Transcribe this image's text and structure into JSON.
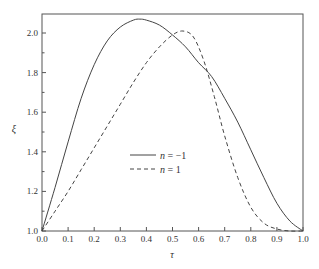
{
  "chart_data": {
    "type": "line",
    "title": "",
    "xlabel": "τ",
    "ylabel": "ξ",
    "xlim": [
      0.0,
      1.0
    ],
    "ylim": [
      1.0,
      2.09
    ],
    "grid": false,
    "legend_position": "center-right inside plot",
    "x_ticks": [
      "0.0",
      "0.1",
      "0.2",
      "0.3",
      "0.4",
      "0.5",
      "0.6",
      "0.7",
      "0.8",
      "0.9",
      "1.0"
    ],
    "y_ticks": [
      "1.0",
      "1.2",
      "1.4",
      "1.6",
      "1.8",
      "2.0"
    ],
    "series": [
      {
        "name": "n = -1",
        "legend_var": "n",
        "legend_value": "= −1",
        "style": "solid",
        "color": "#444444",
        "x": [
          0.0,
          0.05,
          0.1,
          0.15,
          0.2,
          0.25,
          0.3,
          0.35,
          0.375,
          0.4,
          0.45,
          0.5,
          0.55,
          0.6,
          0.65,
          0.7,
          0.75,
          0.8,
          0.85,
          0.9,
          0.95,
          1.0
        ],
        "y": [
          1.0,
          1.22,
          1.45,
          1.67,
          1.84,
          1.96,
          2.03,
          2.065,
          2.07,
          2.065,
          2.04,
          1.99,
          1.93,
          1.85,
          1.78,
          1.67,
          1.55,
          1.41,
          1.27,
          1.14,
          1.05,
          1.0
        ]
      },
      {
        "name": "n = 1",
        "legend_var": "n",
        "legend_value": "= 1",
        "style": "dashed",
        "color": "#444444",
        "x": [
          0.0,
          0.05,
          0.1,
          0.15,
          0.2,
          0.25,
          0.3,
          0.35,
          0.4,
          0.45,
          0.5,
          0.54,
          0.58,
          0.62,
          0.66,
          0.7,
          0.75,
          0.8,
          0.85,
          0.9,
          0.95,
          1.0
        ],
        "y": [
          1.0,
          1.1,
          1.2,
          1.31,
          1.42,
          1.53,
          1.64,
          1.75,
          1.85,
          1.93,
          1.99,
          2.01,
          1.98,
          1.86,
          1.68,
          1.48,
          1.27,
          1.12,
          1.04,
          1.01,
          1.0,
          1.0
        ]
      }
    ]
  }
}
